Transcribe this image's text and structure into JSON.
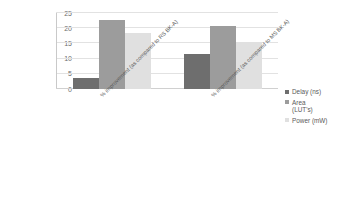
{
  "chart_data": {
    "type": "bar",
    "title": "",
    "subtitle": "",
    "xlabel": "",
    "ylabel": "",
    "categories": [
      "% improvement (as compared to RS BK-A)",
      "% improvement (as compared to MS BK-A)"
    ],
    "series": [
      {
        "name": "Delay (ns)",
        "values": [
          3.7,
          11.6
        ],
        "color": "#6e6e6e"
      },
      {
        "name": "Area\n(LUT's)",
        "values": [
          22.7,
          20.7
        ],
        "color": "#9c9c9c"
      },
      {
        "name": "Power (mW)",
        "values": [
          18.5,
          15.5
        ],
        "color": "#e0e0e0"
      }
    ],
    "ylim": [
      0,
      25
    ],
    "yticks": [
      0,
      5,
      10,
      15,
      20,
      25
    ],
    "ytick_labels": [
      "0",
      "5",
      "10",
      "15",
      "20",
      "25"
    ],
    "grid": true,
    "grid_axis": "y",
    "legend_position": "right"
  },
  "legend": {
    "items": [
      {
        "label": "Delay (ns)",
        "marker": "square-marker"
      },
      {
        "label": "Area\n(LUT's)",
        "marker": "square-marker"
      },
      {
        "label": "Power (mW)",
        "marker": "square-marker"
      }
    ]
  }
}
